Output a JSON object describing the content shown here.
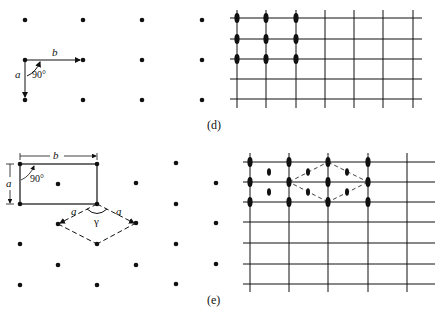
{
  "figure": {
    "header_clipped": "",
    "panel_d": {
      "caption": "(d)",
      "vector_a": "a",
      "vector_b": "b",
      "angle": "90°",
      "lattice_points": [
        [
          25,
          20
        ],
        [
          83,
          20
        ],
        [
          142,
          20
        ],
        [
          202,
          20
        ],
        [
          25,
          60
        ],
        [
          83,
          60
        ],
        [
          142,
          60
        ],
        [
          202,
          60
        ],
        [
          25,
          100
        ],
        [
          83,
          100
        ],
        [
          142,
          100
        ],
        [
          202,
          100
        ]
      ],
      "grid": {
        "vlines_x": [
          237,
          266,
          296,
          325,
          354,
          383,
          413
        ],
        "hlines_y": [
          18,
          39,
          59,
          79,
          99
        ],
        "x_range": [
          230,
          422
        ],
        "y_range": [
          10,
          108
        ],
        "marked_x": [
          237,
          266,
          296
        ],
        "marked_y": [
          18,
          39,
          59
        ]
      }
    },
    "panel_e": {
      "caption": "(e)",
      "rect_label_a": "a",
      "rect_label_b": "b",
      "angle_rect": "90°",
      "rhomb_label_a1": "a",
      "rhomb_label_a2": "a",
      "angle_gamma": "γ",
      "lattice_points": [
        [
          20,
          164
        ],
        [
          97,
          164
        ],
        [
          176,
          163
        ],
        [
          58,
          184
        ],
        [
          136,
          183
        ],
        [
          216,
          183
        ],
        [
          20,
          204
        ],
        [
          97,
          204
        ],
        [
          176,
          204
        ],
        [
          58,
          224
        ],
        [
          136,
          223
        ],
        [
          216,
          223
        ],
        [
          20,
          244
        ],
        [
          97,
          244
        ],
        [
          176,
          244
        ],
        [
          58,
          265
        ],
        [
          136,
          265
        ],
        [
          216,
          264
        ],
        [
          20,
          285
        ],
        [
          97,
          285
        ],
        [
          176,
          284
        ]
      ],
      "grid": {
        "vlines_x": [
          250,
          289,
          328,
          368,
          407
        ],
        "hlines_y": [
          162,
          182,
          202,
          222,
          243,
          264,
          284
        ],
        "x_range": [
          243,
          435
        ],
        "y_range": [
          153,
          292
        ],
        "major_marks": [
          [
            250,
            162
          ],
          [
            289,
            162
          ],
          [
            328,
            162
          ],
          [
            368,
            162
          ],
          [
            250,
            182
          ],
          [
            289,
            182
          ],
          [
            328,
            182
          ],
          [
            368,
            182
          ],
          [
            250,
            202
          ],
          [
            289,
            202
          ],
          [
            328,
            202
          ],
          [
            368,
            202
          ]
        ],
        "minor_marks": [
          [
            269,
            172
          ],
          [
            269,
            192
          ],
          [
            308,
            172
          ],
          [
            308,
            192
          ],
          [
            347,
            172
          ],
          [
            347,
            192
          ]
        ]
      }
    }
  }
}
